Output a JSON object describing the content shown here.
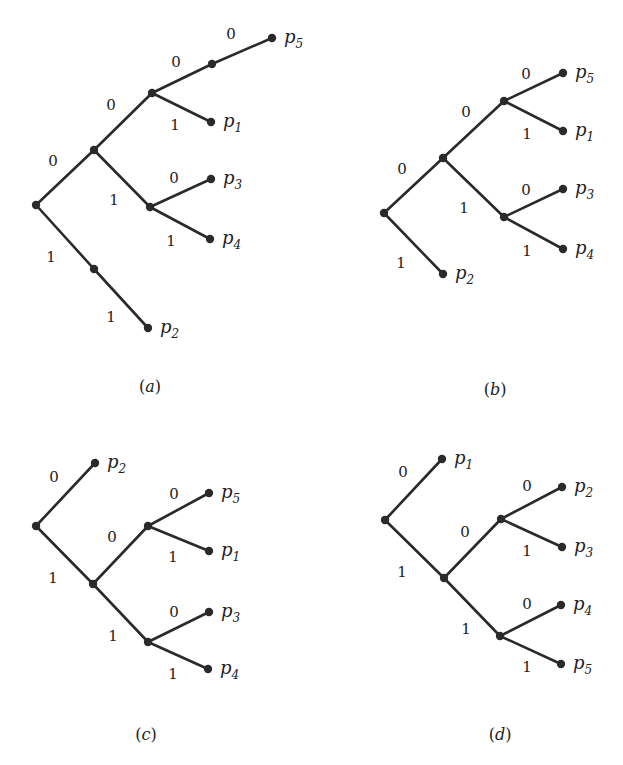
{
  "figure": {
    "trees": [
      {
        "id": "a",
        "caption": "(a)",
        "caption_letter": "a",
        "caption_pos": [
          150,
          392
        ],
        "nodes": [
          {
            "id": "r",
            "x": 36,
            "y": 205
          },
          {
            "id": "n0",
            "x": 94,
            "y": 150
          },
          {
            "id": "n00",
            "x": 152,
            "y": 93
          },
          {
            "id": "n000",
            "x": 212,
            "y": 64
          },
          {
            "id": "p5",
            "x": 272,
            "y": 38,
            "label": "p",
            "sub": "5"
          },
          {
            "id": "p1",
            "x": 211,
            "y": 122,
            "label": "p",
            "sub": "1"
          },
          {
            "id": "n01",
            "x": 150,
            "y": 207
          },
          {
            "id": "p3",
            "x": 211,
            "y": 179,
            "label": "p",
            "sub": "3"
          },
          {
            "id": "p4",
            "x": 210,
            "y": 239,
            "label": "p",
            "sub": "4"
          },
          {
            "id": "n1",
            "x": 94,
            "y": 269
          },
          {
            "id": "p2",
            "x": 148,
            "y": 328,
            "label": "p",
            "sub": "2"
          }
        ],
        "edges": [
          {
            "from": "r",
            "to": "n0",
            "bit": "0",
            "lx": 53,
            "ly": 166
          },
          {
            "from": "n0",
            "to": "n00",
            "bit": "0",
            "lx": 111,
            "ly": 110
          },
          {
            "from": "n00",
            "to": "n000",
            "bit": "0",
            "lx": 176,
            "ly": 67
          },
          {
            "from": "n000",
            "to": "p5",
            "bit": "0",
            "lx": 231,
            "ly": 39
          },
          {
            "from": "n00",
            "to": "p1",
            "bit": "1",
            "lx": 175,
            "ly": 130
          },
          {
            "from": "n0",
            "to": "n01",
            "bit": "1",
            "lx": 114,
            "ly": 205
          },
          {
            "from": "n01",
            "to": "p3",
            "bit": "0",
            "lx": 174,
            "ly": 183
          },
          {
            "from": "n01",
            "to": "p4",
            "bit": "1",
            "lx": 171,
            "ly": 246
          },
          {
            "from": "r",
            "to": "n1",
            "bit": "1",
            "lx": 51,
            "ly": 262
          },
          {
            "from": "n1",
            "to": "p2",
            "bit": "1",
            "lx": 111,
            "ly": 322
          }
        ]
      },
      {
        "id": "b",
        "caption": "(b)",
        "caption_letter": "b",
        "caption_pos": [
          495,
          395
        ],
        "nodes": [
          {
            "id": "r",
            "x": 384,
            "y": 213
          },
          {
            "id": "n0",
            "x": 443,
            "y": 158
          },
          {
            "id": "n00",
            "x": 504,
            "y": 101
          },
          {
            "id": "p5",
            "x": 563,
            "y": 73,
            "label": "p",
            "sub": "5"
          },
          {
            "id": "p1",
            "x": 563,
            "y": 131,
            "label": "p",
            "sub": "1"
          },
          {
            "id": "n01",
            "x": 504,
            "y": 217
          },
          {
            "id": "p3",
            "x": 563,
            "y": 189,
            "label": "p",
            "sub": "3"
          },
          {
            "id": "p4",
            "x": 563,
            "y": 249,
            "label": "p",
            "sub": "4"
          },
          {
            "id": "p2",
            "x": 443,
            "y": 274,
            "label": "p",
            "sub": "2"
          }
        ],
        "edges": [
          {
            "from": "r",
            "to": "n0",
            "bit": "0",
            "lx": 402,
            "ly": 174
          },
          {
            "from": "n0",
            "to": "n00",
            "bit": "0",
            "lx": 466,
            "ly": 117
          },
          {
            "from": "n00",
            "to": "p5",
            "bit": "0",
            "lx": 526,
            "ly": 79
          },
          {
            "from": "n00",
            "to": "p1",
            "bit": "1",
            "lx": 527,
            "ly": 139
          },
          {
            "from": "n0",
            "to": "n01",
            "bit": "1",
            "lx": 464,
            "ly": 213
          },
          {
            "from": "n01",
            "to": "p3",
            "bit": "0",
            "lx": 526,
            "ly": 195
          },
          {
            "from": "n01",
            "to": "p4",
            "bit": "1",
            "lx": 527,
            "ly": 256
          },
          {
            "from": "r",
            "to": "p2",
            "bit": "1",
            "lx": 401,
            "ly": 268
          }
        ]
      },
      {
        "id": "c",
        "caption": "(c)",
        "caption_letter": "c",
        "caption_pos": [
          146,
          740
        ],
        "nodes": [
          {
            "id": "r",
            "x": 36,
            "y": 526
          },
          {
            "id": "p2",
            "x": 95,
            "y": 463,
            "label": "p",
            "sub": "2"
          },
          {
            "id": "n1",
            "x": 93,
            "y": 584
          },
          {
            "id": "n10",
            "x": 148,
            "y": 526
          },
          {
            "id": "p5",
            "x": 209,
            "y": 493,
            "label": "p",
            "sub": "5"
          },
          {
            "id": "p1",
            "x": 209,
            "y": 551,
            "label": "p",
            "sub": "1"
          },
          {
            "id": "n11",
            "x": 148,
            "y": 642
          },
          {
            "id": "p3",
            "x": 209,
            "y": 612,
            "label": "p",
            "sub": "3"
          },
          {
            "id": "p4",
            "x": 208,
            "y": 669,
            "label": "p",
            "sub": "4"
          }
        ],
        "edges": [
          {
            "from": "r",
            "to": "p2",
            "bit": "0",
            "lx": 54,
            "ly": 482
          },
          {
            "from": "r",
            "to": "n1",
            "bit": "1",
            "lx": 53,
            "ly": 583
          },
          {
            "from": "n1",
            "to": "n10",
            "bit": "0",
            "lx": 112,
            "ly": 542
          },
          {
            "from": "n10",
            "to": "p5",
            "bit": "0",
            "lx": 174,
            "ly": 499
          },
          {
            "from": "n10",
            "to": "p1",
            "bit": "1",
            "lx": 173,
            "ly": 562
          },
          {
            "from": "n1",
            "to": "n11",
            "bit": "1",
            "lx": 113,
            "ly": 641
          },
          {
            "from": "n11",
            "to": "p3",
            "bit": "0",
            "lx": 174,
            "ly": 617
          },
          {
            "from": "n11",
            "to": "p4",
            "bit": "1",
            "lx": 173,
            "ly": 679
          }
        ]
      },
      {
        "id": "d",
        "caption": "(d)",
        "caption_letter": "d",
        "caption_pos": [
          500,
          740
        ],
        "nodes": [
          {
            "id": "r",
            "x": 385,
            "y": 520
          },
          {
            "id": "p1",
            "x": 442,
            "y": 459,
            "label": "p",
            "sub": "1"
          },
          {
            "id": "n1",
            "x": 444,
            "y": 578
          },
          {
            "id": "n10",
            "x": 501,
            "y": 519
          },
          {
            "id": "p2",
            "x": 562,
            "y": 487,
            "label": "p",
            "sub": "2"
          },
          {
            "id": "p3",
            "x": 562,
            "y": 547,
            "label": "p",
            "sub": "3"
          },
          {
            "id": "n11",
            "x": 500,
            "y": 636
          },
          {
            "id": "p4",
            "x": 561,
            "y": 605,
            "label": "p",
            "sub": "4"
          },
          {
            "id": "p5",
            "x": 561,
            "y": 664,
            "label": "p",
            "sub": "5"
          }
        ],
        "edges": [
          {
            "from": "r",
            "to": "p1",
            "bit": "0",
            "lx": 403,
            "ly": 477
          },
          {
            "from": "r",
            "to": "n1",
            "bit": "1",
            "lx": 402,
            "ly": 577
          },
          {
            "from": "n1",
            "to": "n10",
            "bit": "0",
            "lx": 465,
            "ly": 537
          },
          {
            "from": "n10",
            "to": "p2",
            "bit": "0",
            "lx": 527,
            "ly": 491
          },
          {
            "from": "n10",
            "to": "p3",
            "bit": "1",
            "lx": 527,
            "ly": 556
          },
          {
            "from": "n1",
            "to": "n11",
            "bit": "1",
            "lx": 466,
            "ly": 634
          },
          {
            "from": "n11",
            "to": "p4",
            "bit": "0",
            "lx": 527,
            "ly": 609
          },
          {
            "from": "n11",
            "to": "p5",
            "bit": "1",
            "lx": 527,
            "ly": 672
          }
        ]
      }
    ]
  }
}
